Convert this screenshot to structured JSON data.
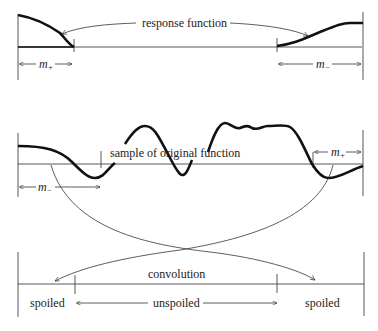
{
  "labels": {
    "response_function": "response function",
    "sample": "sample of original function",
    "convolution": "convolution",
    "spoiled_left": "spoiled",
    "unspoiled": "unspoiled",
    "spoiled_right": "spoiled",
    "m_plus_top": "m",
    "m_plus_top_sub": "+",
    "m_minus_top": "m",
    "m_minus_top_sub": "−",
    "m_minus_mid": "m",
    "m_minus_mid_sub": "−",
    "m_plus_mid": "m",
    "m_plus_mid_sub": "+"
  },
  "colors": {
    "curve": "#111111",
    "line": "#333333",
    "background": "#ffffff"
  }
}
